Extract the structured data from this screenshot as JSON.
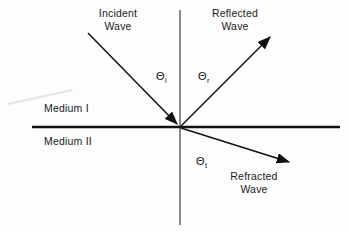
{
  "diagram": {
    "background_color": "#fdfdfd",
    "line_color": "#111111",
    "text_color": "#1a1a1a",
    "artifact_color": "#e2e2e2",
    "labels": {
      "incident_wave_line1": "Incident",
      "incident_wave_line2": "Wave",
      "reflected_wave_line1": "Reflected",
      "reflected_wave_line2": "Wave",
      "refracted_wave_line1": "Refracted",
      "refracted_wave_line2": "Wave",
      "medium_one": "Medium I",
      "medium_two": "Medium II",
      "theta_incident_symbol": "Θ",
      "theta_incident_subscript": "i",
      "theta_reflected_symbol": "Θ",
      "theta_reflected_subscript": "r",
      "theta_transmitted_symbol": "Θ",
      "theta_transmitted_subscript": "t"
    },
    "geometry": {
      "origin": {
        "x": 180,
        "y": 127
      },
      "interface_line": {
        "x1": 32,
        "y1": 127,
        "x2": 340,
        "y2": 127,
        "width": 2.6
      },
      "normal_line": {
        "x1": 180,
        "y1": 10,
        "x2": 180,
        "y2": 225,
        "width": 1.1
      },
      "incident_ray": {
        "x1": 88,
        "y1": 33,
        "x2": 180,
        "y2": 127,
        "arrow_at": "end"
      },
      "reflected_ray": {
        "x1": 180,
        "y1": 127,
        "x2": 272,
        "y2": 35,
        "arrow_at": "end"
      },
      "refracted_ray": {
        "x1": 180,
        "y1": 127,
        "x2": 292,
        "y2": 163,
        "arrow_at": "end"
      },
      "scan_artifact": {
        "x1": 8,
        "y1": 104,
        "x2": 72,
        "y2": 90
      }
    }
  }
}
